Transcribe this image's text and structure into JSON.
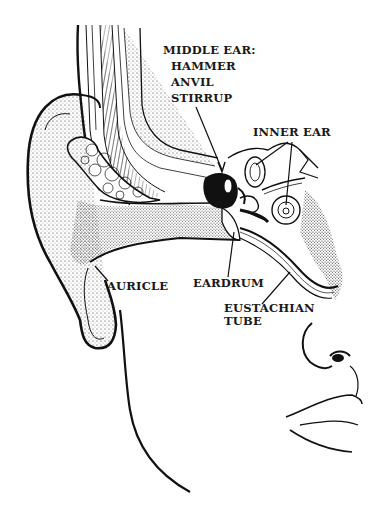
{
  "diagram": {
    "labels": {
      "middle_ear": {
        "title": "MIDDLE EAR:",
        "parts": [
          "HAMMER",
          "ANVIL",
          "STIRRUP"
        ]
      },
      "inner_ear": "INNER EAR",
      "eardrum": "EARDRUM",
      "auricle": "AURICLE",
      "eustachian_tube": [
        "EUSTACHIAN",
        "TUBE"
      ]
    },
    "colors": {
      "ink": "#111111",
      "paper": "#ffffff"
    }
  }
}
